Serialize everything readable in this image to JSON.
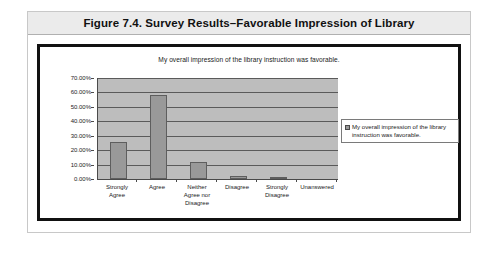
{
  "figure": {
    "caption": "Figure 7.4.  Survey Results–Favorable Impression of Library"
  },
  "legend": {
    "marker": "square-marker",
    "label": "My overall impression of the library instruction was favorable."
  },
  "chart_data": {
    "type": "bar",
    "title": "My overall impression of the library instruction was favorable.",
    "xlabel": "",
    "ylabel": "",
    "categories": [
      "Strongly Agree",
      "Agree",
      "Neither Agree nor Disagree",
      "Disagree",
      "Strongly Disagree",
      "Unanswered"
    ],
    "category_lines": [
      [
        "Strongly",
        "Agree"
      ],
      [
        "Agree"
      ],
      [
        "Neither",
        "Agree nor",
        "Disagree"
      ],
      [
        "Disagree"
      ],
      [
        "Strongly",
        "Disagree"
      ],
      [
        "Unanswered"
      ]
    ],
    "values": [
      26.0,
      58.0,
      12.0,
      2.0,
      1.0,
      0.0
    ],
    "series": [
      {
        "name": "My overall impression of the library instruction was favorable.",
        "values": [
          26.0,
          58.0,
          12.0,
          2.0,
          1.0,
          0.0
        ]
      }
    ],
    "ylim": [
      0,
      70
    ],
    "ytick_values": [
      0,
      10,
      20,
      30,
      40,
      50,
      60,
      70
    ],
    "ytick_labels": [
      "0.00%",
      "10.00%",
      "20.00%",
      "30.00%",
      "40.00%",
      "50.00%",
      "60.00%",
      "70.00%"
    ],
    "grid": true,
    "legend_position": "right",
    "colors": {
      "bar_fill": "#999999",
      "bar_border": "#5e5e5e",
      "plot_background": "#bdbdbd",
      "gridline": "#5a5a5a",
      "axis": "#4a4a4a",
      "frame": "#111111",
      "caption_band": "#ebebeb"
    }
  }
}
